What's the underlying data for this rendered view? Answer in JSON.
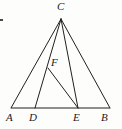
{
  "figure": {
    "type": "geometry-diagram",
    "canvas": {
      "width": 122,
      "height": 129
    },
    "stroke_color": "#22201f",
    "background_color": "#fdfdfc",
    "points": [
      {
        "id": "A",
        "label": "A",
        "x": 11,
        "y": 108,
        "label_x": 6,
        "label_y": 112
      },
      {
        "id": "D",
        "label": "D",
        "x": 35,
        "y": 108,
        "label_x": 29,
        "label_y": 112
      },
      {
        "id": "E",
        "label": "E",
        "x": 78,
        "y": 108,
        "label_x": 73,
        "label_y": 112
      },
      {
        "id": "B",
        "label": "B",
        "x": 110,
        "y": 108,
        "label_x": 101,
        "label_y": 112
      },
      {
        "id": "C",
        "label": "C",
        "x": 61,
        "y": 19,
        "label_x": 57,
        "label_y": 1
      },
      {
        "id": "F",
        "label": "F",
        "x": 48,
        "y": 68,
        "label_x": 51,
        "label_y": 57
      }
    ],
    "segments": [
      {
        "name": "base-AB",
        "from": "A",
        "to": "B",
        "kind": "baseline"
      },
      {
        "name": "side-AC",
        "from": "A",
        "to": "C",
        "kind": "edge"
      },
      {
        "name": "side-BC",
        "from": "B",
        "to": "C",
        "kind": "edge"
      },
      {
        "name": "cevian-CD",
        "from": "C",
        "to": "D",
        "kind": "edge"
      },
      {
        "name": "cevian-CE",
        "from": "C",
        "to": "E",
        "kind": "edge"
      },
      {
        "name": "segment-FE",
        "from": "F",
        "to": "E",
        "kind": "edge"
      }
    ],
    "marks": [
      {
        "name": "scan-speck",
        "x": 0,
        "y": 19,
        "width": 3,
        "height": 2
      }
    ]
  }
}
